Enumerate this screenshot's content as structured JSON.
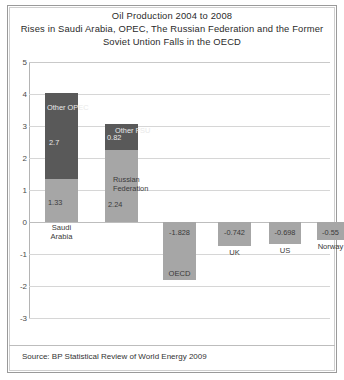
{
  "title": {
    "line1": "Oil Production   2004 to 2008",
    "line2": "Rises in Saudi Arabia, OPEC, The Russian Federation and the Former",
    "line3": "Soviet Untion Falls in the OECD"
  },
  "source": "Source: BP Statistical Review of World Energy 2009",
  "colors": {
    "dark_segment": "#595959",
    "light_segment": "#a6a6a6",
    "gridline": "#d6d6d6",
    "axis": "#b4b4b4",
    "frame": "#9a9a9a",
    "text": "#333333"
  },
  "axis": {
    "ticks": [
      "5",
      "4",
      "3",
      "2",
      "1",
      "0",
      "-1",
      "-2",
      "-3"
    ]
  },
  "chart_data": {
    "type": "bar",
    "title": "Oil Production   2004 to 2008 Rises in Saudi Arabia, OPEC, The Russian Federation and the Former Soviet Untion Falls in the OECD",
    "xlabel": "",
    "ylabel": "",
    "ylim": [
      -3,
      5
    ],
    "grid": true,
    "legend": "none",
    "stacked": true,
    "annotation": "Source: BP Statistical Review of World Energy 2009",
    "categories": [
      "Saudi Arabia",
      "Russian Federation",
      "OECD",
      "UK",
      "US",
      "Norway"
    ],
    "series": [
      {
        "name": "Base",
        "color": "#a6a6a6",
        "values": [
          1.33,
          2.24,
          -1.828,
          -0.742,
          -0.698,
          -0.55
        ]
      },
      {
        "name": "Additional",
        "color": "#595959",
        "values": [
          2.7,
          0.82,
          0,
          0,
          0,
          0
        ]
      }
    ],
    "bars": [
      {
        "category": "Saudi Arabia",
        "category_label_line1": "Saudi",
        "category_label_line2": "Arabia",
        "total": 4.03,
        "segments": [
          {
            "name": "Saudi Arabia",
            "label": "1.33",
            "value": 1.33,
            "from": 0,
            "to": 1.33,
            "shade": "mid"
          },
          {
            "name": "Other OPEC",
            "label": "2.7",
            "value": 2.7,
            "from": 1.33,
            "to": 4.03,
            "shade": "dark",
            "title": "Other OPEC"
          }
        ]
      },
      {
        "category": "Russian Federation",
        "category_label_line1": "",
        "category_label_line2": "",
        "total": 3.06,
        "segments": [
          {
            "name": "Russian Federation",
            "label": "2.24",
            "value": 2.24,
            "from": 0,
            "to": 2.24,
            "shade": "mid",
            "title": "Russian Federation"
          },
          {
            "name": "Other FSU",
            "label": "0.82",
            "value": 0.82,
            "from": 2.24,
            "to": 3.06,
            "shade": "dark",
            "title": "Other FSU"
          }
        ]
      },
      {
        "category": "OECD",
        "category_label_line1": "OECD",
        "category_label_line2": "",
        "total": -1.828,
        "segments": [
          {
            "name": "OECD",
            "label": "-1.828",
            "value": -1.828,
            "from": 0,
            "to": -1.828,
            "shade": "neg"
          }
        ]
      },
      {
        "category": "UK",
        "category_label_line1": "UK",
        "category_label_line2": "",
        "total": -0.742,
        "segments": [
          {
            "name": "UK",
            "label": "-0.742",
            "value": -0.742,
            "from": 0,
            "to": -0.742,
            "shade": "neg"
          }
        ]
      },
      {
        "category": "US",
        "category_label_line1": "US",
        "category_label_line2": "",
        "total": -0.698,
        "segments": [
          {
            "name": "US",
            "label": "-0.698",
            "value": -0.698,
            "from": 0,
            "to": -0.698,
            "shade": "neg"
          }
        ]
      },
      {
        "category": "Norway",
        "category_label_line1": "Norway",
        "category_label_line2": "",
        "total": -0.55,
        "segments": [
          {
            "name": "Norway",
            "label": "-0.55",
            "value": -0.55,
            "from": 0,
            "to": -0.55,
            "shade": "neg"
          }
        ]
      }
    ]
  }
}
